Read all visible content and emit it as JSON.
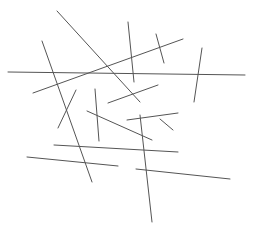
{
  "canvas": {
    "width": 254,
    "height": 238,
    "background": "#ffffff"
  },
  "stroke": {
    "color": "#555555",
    "width": 1
  },
  "lines": [
    {
      "x1": 57,
      "y1": 11,
      "x2": 140,
      "y2": 102
    },
    {
      "x1": 42,
      "y1": 41,
      "x2": 92,
      "y2": 182
    },
    {
      "x1": 8,
      "y1": 72,
      "x2": 245,
      "y2": 75
    },
    {
      "x1": 33,
      "y1": 93,
      "x2": 183,
      "y2": 39
    },
    {
      "x1": 128,
      "y1": 22,
      "x2": 134,
      "y2": 82
    },
    {
      "x1": 156,
      "y1": 34,
      "x2": 164,
      "y2": 63
    },
    {
      "x1": 202,
      "y1": 48,
      "x2": 194,
      "y2": 102
    },
    {
      "x1": 108,
      "y1": 103,
      "x2": 158,
      "y2": 85
    },
    {
      "x1": 76,
      "y1": 90,
      "x2": 58,
      "y2": 128
    },
    {
      "x1": 95,
      "y1": 89,
      "x2": 99,
      "y2": 141
    },
    {
      "x1": 87,
      "y1": 111,
      "x2": 152,
      "y2": 140
    },
    {
      "x1": 127,
      "y1": 120,
      "x2": 178,
      "y2": 113
    },
    {
      "x1": 54,
      "y1": 145,
      "x2": 178,
      "y2": 152
    },
    {
      "x1": 27,
      "y1": 157,
      "x2": 118,
      "y2": 166
    },
    {
      "x1": 140,
      "y1": 115,
      "x2": 152,
      "y2": 222
    },
    {
      "x1": 136,
      "y1": 169,
      "x2": 230,
      "y2": 179
    },
    {
      "x1": 160,
      "y1": 119,
      "x2": 173,
      "y2": 130
    }
  ]
}
